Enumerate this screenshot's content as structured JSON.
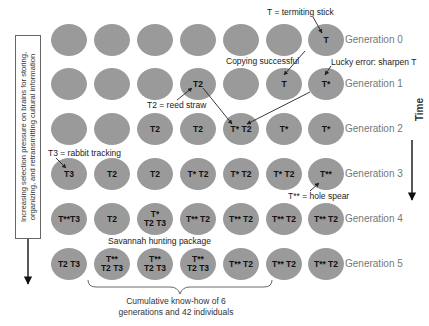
{
  "diagram": {
    "left_box_text": "Increasing selection pressure on brains for storing, organizing, and retransmitting cultural information",
    "time_label": "Time",
    "generations": [
      {
        "label": "Generation 0",
        "nodes": [
          "",
          "",
          "",
          "",
          "",
          "",
          "T"
        ]
      },
      {
        "label": "Generation 1",
        "nodes": [
          "",
          "",
          "",
          "T2",
          "",
          "T",
          "T*"
        ]
      },
      {
        "label": "Generation 2",
        "nodes": [
          "",
          "",
          "T2",
          "T2",
          "T* T2",
          "T*",
          "T*"
        ]
      },
      {
        "label": "Generation 3",
        "nodes": [
          "T3",
          "T2",
          "T2",
          "T* T2",
          "T* T2",
          "T* T2",
          "T**"
        ]
      },
      {
        "label": "Generation 4",
        "nodes": [
          "T**T3",
          "T2",
          "T*\nT2 T3",
          "T** T2",
          "T** T2",
          "T** T2",
          "T** T2"
        ]
      },
      {
        "label": "Generation 5",
        "nodes": [
          "T2 T3",
          "T**\nT2 T3",
          "T**\nT2 T3",
          "T**\nT2 T3",
          "T** T2",
          "T** T2",
          "T** T2"
        ]
      }
    ],
    "annotations": {
      "termiting_stick": "T = termiting stick",
      "copying_successful": "Copying successful",
      "lucky_error": "Lucky error: sharpen T",
      "reed_straw": "T2 = reed straw",
      "rabbit_tracking": "T3 = rabbit tracking",
      "hole_spear": "T** = hole spear",
      "savannah_package": "Savannah hunting package",
      "cumulative_line1": "Cumulative know-how of 6",
      "cumulative_line2": "generations and 42 individuals"
    },
    "colors": {
      "node_fill": "#9a9a9a",
      "generation_label": "#777777",
      "arrow": "#222222"
    }
  }
}
